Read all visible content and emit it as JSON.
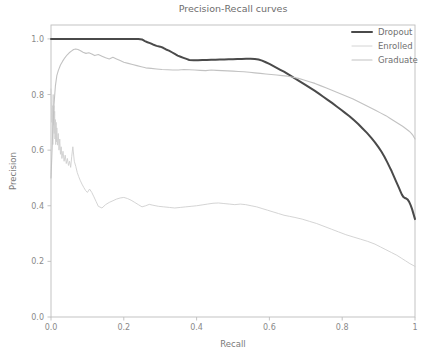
{
  "chart_data": {
    "type": "line",
    "title": "Precision-Recall curves",
    "xlabel": "Recall",
    "ylabel": "Precision",
    "xlim": [
      0.0,
      1.0
    ],
    "ylim": [
      0.0,
      1.05
    ],
    "grid": false,
    "legend_position": "upper right",
    "xticks": [
      "0.0",
      "0.2",
      "0.4",
      "0.6",
      "0.8",
      "1"
    ],
    "xtick_values": [
      0.0,
      0.2,
      0.4,
      0.6,
      0.8,
      1.0
    ],
    "yticks": [
      "0.0",
      "0.2",
      "0.4",
      "0.6",
      "0.8",
      "1.0"
    ],
    "ytick_values": [
      0.0,
      0.2,
      0.4,
      0.6,
      0.8,
      1.0
    ],
    "series": [
      {
        "name": "Dropout",
        "color": "#4a4a4a",
        "linewidth": 2.0,
        "x": [
          0.0,
          0.01,
          0.03,
          0.06,
          0.09,
          0.12,
          0.15,
          0.18,
          0.21,
          0.24,
          0.25,
          0.258,
          0.265,
          0.272,
          0.28,
          0.29,
          0.3,
          0.308,
          0.316,
          0.324,
          0.332,
          0.34,
          0.348,
          0.356,
          0.364,
          0.372,
          0.38,
          0.392,
          0.404,
          0.416,
          0.428,
          0.44,
          0.452,
          0.464,
          0.476,
          0.488,
          0.5,
          0.512,
          0.524,
          0.536,
          0.548,
          0.56,
          0.57,
          0.58,
          0.59,
          0.6,
          0.61,
          0.62,
          0.63,
          0.64,
          0.65,
          0.66,
          0.67,
          0.68,
          0.69,
          0.7,
          0.712,
          0.724,
          0.736,
          0.748,
          0.76,
          0.772,
          0.784,
          0.796,
          0.808,
          0.82,
          0.832,
          0.844,
          0.856,
          0.868,
          0.88,
          0.89,
          0.9,
          0.908,
          0.916,
          0.924,
          0.93,
          0.936,
          0.942,
          0.948,
          0.952,
          0.956,
          0.96,
          0.964,
          0.968,
          0.972,
          0.976,
          0.98,
          0.984,
          0.988,
          0.992,
          0.996,
          1.0
        ],
        "y": [
          1.0,
          1.0,
          1.0,
          1.0,
          1.0,
          1.0,
          1.0,
          1.0,
          1.0,
          1.0,
          0.998,
          0.992,
          0.988,
          0.985,
          0.98,
          0.975,
          0.972,
          0.968,
          0.962,
          0.958,
          0.952,
          0.946,
          0.94,
          0.936,
          0.932,
          0.928,
          0.924,
          0.923,
          0.923,
          0.924,
          0.924,
          0.925,
          0.925,
          0.926,
          0.926,
          0.927,
          0.927,
          0.928,
          0.928,
          0.929,
          0.929,
          0.928,
          0.926,
          0.922,
          0.916,
          0.91,
          0.903,
          0.896,
          0.889,
          0.882,
          0.874,
          0.866,
          0.858,
          0.85,
          0.842,
          0.834,
          0.824,
          0.814,
          0.803,
          0.792,
          0.781,
          0.77,
          0.758,
          0.746,
          0.734,
          0.722,
          0.708,
          0.694,
          0.678,
          0.662,
          0.644,
          0.628,
          0.61,
          0.594,
          0.576,
          0.556,
          0.54,
          0.524,
          0.506,
          0.488,
          0.476,
          0.464,
          0.452,
          0.44,
          0.432,
          0.428,
          0.426,
          0.422,
          0.414,
          0.402,
          0.388,
          0.37,
          0.352
        ]
      },
      {
        "name": "Enrolled",
        "color": "#cfcfcf",
        "linewidth": 0.9,
        "x": [
          0.0,
          0.002,
          0.004,
          0.005,
          0.006,
          0.007,
          0.008,
          0.009,
          0.01,
          0.011,
          0.012,
          0.013,
          0.014,
          0.015,
          0.016,
          0.018,
          0.02,
          0.022,
          0.024,
          0.026,
          0.028,
          0.03,
          0.033,
          0.036,
          0.039,
          0.042,
          0.045,
          0.048,
          0.051,
          0.054,
          0.057,
          0.06,
          0.064,
          0.068,
          0.072,
          0.076,
          0.08,
          0.085,
          0.09,
          0.095,
          0.1,
          0.106,
          0.112,
          0.118,
          0.124,
          0.13,
          0.14,
          0.15,
          0.16,
          0.17,
          0.18,
          0.19,
          0.2,
          0.21,
          0.22,
          0.23,
          0.24,
          0.25,
          0.26,
          0.27,
          0.28,
          0.295,
          0.31,
          0.325,
          0.34,
          0.355,
          0.37,
          0.385,
          0.4,
          0.415,
          0.43,
          0.445,
          0.46,
          0.475,
          0.49,
          0.505,
          0.52,
          0.535,
          0.55,
          0.565,
          0.58,
          0.595,
          0.61,
          0.625,
          0.64,
          0.655,
          0.67,
          0.69,
          0.71,
          0.73,
          0.75,
          0.77,
          0.79,
          0.81,
          0.83,
          0.85,
          0.87,
          0.89,
          0.905,
          0.92,
          0.935,
          0.95,
          0.962,
          0.974,
          0.986,
          1.0
        ],
        "y": [
          0.82,
          0.7,
          0.76,
          0.62,
          0.8,
          0.69,
          0.76,
          0.66,
          0.74,
          0.64,
          0.71,
          0.62,
          0.7,
          0.63,
          0.68,
          0.618,
          0.66,
          0.6,
          0.64,
          0.585,
          0.612,
          0.57,
          0.596,
          0.56,
          0.582,
          0.552,
          0.57,
          0.545,
          0.56,
          0.538,
          0.578,
          0.612,
          0.56,
          0.542,
          0.52,
          0.505,
          0.492,
          0.478,
          0.466,
          0.455,
          0.448,
          0.46,
          0.448,
          0.432,
          0.415,
          0.398,
          0.392,
          0.404,
          0.412,
          0.418,
          0.424,
          0.428,
          0.43,
          0.426,
          0.42,
          0.412,
          0.404,
          0.396,
          0.4,
          0.405,
          0.402,
          0.398,
          0.396,
          0.394,
          0.392,
          0.394,
          0.396,
          0.398,
          0.4,
          0.403,
          0.406,
          0.409,
          0.41,
          0.408,
          0.406,
          0.404,
          0.406,
          0.404,
          0.4,
          0.396,
          0.39,
          0.384,
          0.378,
          0.372,
          0.366,
          0.362,
          0.358,
          0.352,
          0.344,
          0.336,
          0.326,
          0.316,
          0.306,
          0.296,
          0.288,
          0.28,
          0.272,
          0.262,
          0.252,
          0.242,
          0.232,
          0.222,
          0.212,
          0.202,
          0.192,
          0.182
        ]
      },
      {
        "name": "Graduate",
        "color": "#c2c2c2",
        "linewidth": 1.1,
        "x": [
          0.0,
          0.004,
          0.008,
          0.012,
          0.016,
          0.02,
          0.026,
          0.032,
          0.038,
          0.044,
          0.05,
          0.056,
          0.062,
          0.068,
          0.074,
          0.08,
          0.088,
          0.096,
          0.104,
          0.112,
          0.12,
          0.13,
          0.14,
          0.15,
          0.16,
          0.17,
          0.18,
          0.19,
          0.2,
          0.212,
          0.224,
          0.236,
          0.248,
          0.26,
          0.275,
          0.29,
          0.305,
          0.32,
          0.335,
          0.35,
          0.365,
          0.38,
          0.395,
          0.41,
          0.425,
          0.44,
          0.455,
          0.47,
          0.485,
          0.5,
          0.515,
          0.53,
          0.545,
          0.56,
          0.575,
          0.59,
          0.605,
          0.62,
          0.635,
          0.65,
          0.665,
          0.68,
          0.695,
          0.71,
          0.725,
          0.74,
          0.755,
          0.77,
          0.785,
          0.8,
          0.815,
          0.83,
          0.845,
          0.86,
          0.875,
          0.89,
          0.905,
          0.92,
          0.932,
          0.944,
          0.956,
          0.966,
          0.976,
          0.984,
          0.99,
          0.995,
          1.0
        ],
        "y": [
          0.5,
          0.64,
          0.76,
          0.83,
          0.868,
          0.886,
          0.906,
          0.92,
          0.932,
          0.942,
          0.95,
          0.956,
          0.962,
          0.964,
          0.962,
          0.958,
          0.952,
          0.948,
          0.95,
          0.946,
          0.94,
          0.944,
          0.938,
          0.932,
          0.928,
          0.934,
          0.928,
          0.922,
          0.916,
          0.912,
          0.908,
          0.904,
          0.9,
          0.896,
          0.894,
          0.892,
          0.89,
          0.889,
          0.888,
          0.888,
          0.89,
          0.889,
          0.888,
          0.887,
          0.886,
          0.888,
          0.887,
          0.886,
          0.885,
          0.884,
          0.883,
          0.882,
          0.88,
          0.878,
          0.876,
          0.874,
          0.872,
          0.87,
          0.868,
          0.866,
          0.862,
          0.858,
          0.852,
          0.846,
          0.84,
          0.832,
          0.824,
          0.816,
          0.808,
          0.8,
          0.792,
          0.784,
          0.774,
          0.764,
          0.754,
          0.744,
          0.734,
          0.724,
          0.714,
          0.704,
          0.694,
          0.686,
          0.676,
          0.668,
          0.66,
          0.652,
          0.64
        ]
      }
    ]
  },
  "legend": {
    "entries": [
      {
        "label": "Dropout"
      },
      {
        "label": "Enrolled"
      },
      {
        "label": "Graduate"
      }
    ]
  }
}
